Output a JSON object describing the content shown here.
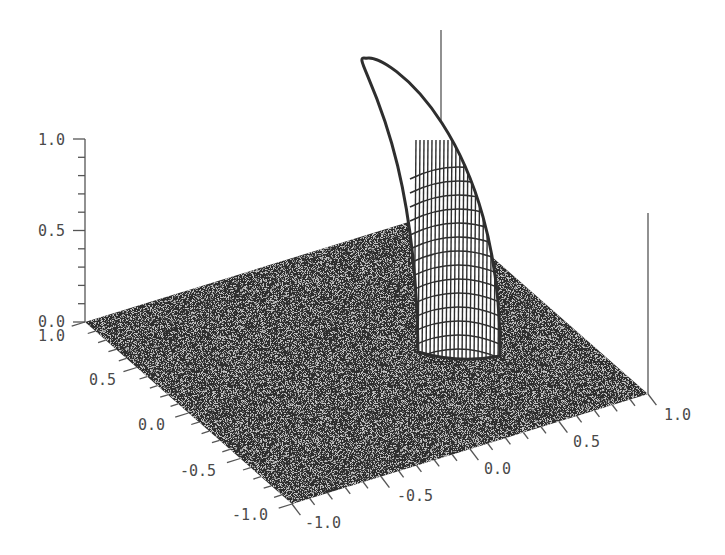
{
  "chart_data": {
    "type": "surface",
    "title": "",
    "xlabel": "",
    "ylabel": "",
    "zlabel": "",
    "x_axis": {
      "range": [
        -1.0,
        1.0
      ],
      "tick_labels": [
        "-1.0",
        "-0.5",
        "0.0",
        "0.5",
        "1.0"
      ],
      "minor_step": 0.1
    },
    "y_axis": {
      "range": [
        -1.0,
        1.0
      ],
      "tick_labels": [
        "-1.0",
        "-0.5",
        "0.0",
        "0.5",
        "1.0"
      ],
      "minor_step": 0.1
    },
    "z_axis": {
      "range": [
        0.0,
        1.0
      ],
      "tick_labels": [
        "0.0",
        "0.5",
        "1.0"
      ],
      "minor_step": 0.1
    },
    "peak": {
      "x": 0.55,
      "y": 0.95,
      "z_max": 1.0,
      "radius": 0.22
    },
    "grid": true,
    "legend": null,
    "colors": {
      "mesh": "#2e2e2e",
      "peak_fill": "#ffffff",
      "axis": "#555555",
      "label": "#4a4a4a",
      "background": "#ffffff"
    }
  },
  "projection": {
    "corner_left": [
      85,
      322
    ],
    "corner_bottom": [
      292,
      504
    ],
    "corner_right": [
      648,
      394
    ],
    "z_height_px": 183
  },
  "labels": {
    "z": [
      {
        "text": "1.0",
        "x": 38,
        "y": 145
      },
      {
        "text": "0.5",
        "x": 38,
        "y": 236
      },
      {
        "text": "0.0",
        "x": 38,
        "y": 327
      }
    ],
    "y": [
      {
        "text": "1.0",
        "x": 38,
        "y": 341
      },
      {
        "text": "0.5",
        "x": 89,
        "y": 385
      },
      {
        "text": "0.0",
        "x": 138,
        "y": 430
      },
      {
        "text": "-0.5",
        "x": 180,
        "y": 476
      },
      {
        "text": "-1.0",
        "x": 232,
        "y": 520
      }
    ],
    "x": [
      {
        "text": "-1.0",
        "x": 305,
        "y": 528
      },
      {
        "text": "-0.5",
        "x": 397,
        "y": 501
      },
      {
        "text": "0.0",
        "x": 484,
        "y": 474
      },
      {
        "text": "0.5",
        "x": 573,
        "y": 447
      },
      {
        "text": "1.0",
        "x": 664,
        "y": 420
      }
    ]
  }
}
